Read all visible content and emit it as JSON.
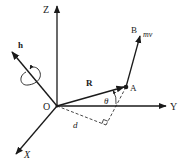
{
  "diagram": {
    "labels": {
      "z_axis": "Z",
      "y_axis": "Y",
      "x_axis": "X",
      "origin": "O",
      "angular_momentum": "h",
      "position_vector": "R",
      "point_a": "A",
      "point_b": "B",
      "momentum": "mv",
      "angle": "θ",
      "distance": "d"
    },
    "colors": {
      "line": "#1a1a1a",
      "background": "#ffffff"
    }
  }
}
